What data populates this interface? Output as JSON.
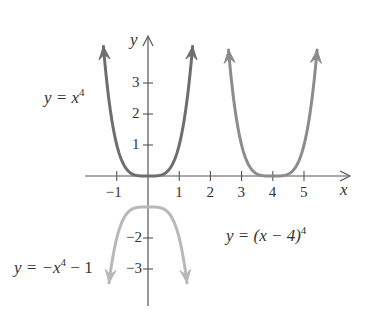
{
  "chart_data": {
    "type": "line",
    "title": "",
    "xlabel": "x",
    "ylabel": "y",
    "xlim": [
      -2,
      6.5
    ],
    "ylim": [
      -4.3,
      4.5
    ],
    "grid": false,
    "x_ticks": [
      -1,
      1,
      2,
      3,
      4,
      5
    ],
    "y_ticks": [
      -3,
      -2,
      -1,
      1,
      2,
      3
    ],
    "x_tick_labels": [
      "−1",
      "1",
      "2",
      "3",
      "4",
      "5"
    ],
    "y_tick_labels": [
      "−3",
      "−2",
      "1",
      "2",
      "3"
    ],
    "series": [
      {
        "name": "y = x^4",
        "expr": "x^4",
        "color": "#6e6e6e",
        "domain": [
          -1.43,
          1.43
        ],
        "direction": "up"
      },
      {
        "name": "y = (x - 4)^4",
        "expr": "(x-4)^4",
        "color": "#8c8c8c",
        "domain": [
          2.58,
          5.42
        ],
        "direction": "up"
      },
      {
        "name": "y = -x^4 - 1",
        "expr": "-x^4-1",
        "color": "#b8b8b8",
        "domain": [
          -1.25,
          1.25
        ],
        "direction": "down"
      }
    ],
    "annotations": [
      {
        "text": "y = x^4",
        "near": "upper-left"
      },
      {
        "text": "y = (x − 4)^4",
        "near": "lower-right"
      },
      {
        "text": "y = −x^4 − 1",
        "near": "lower-left"
      }
    ],
    "legend": "none (inline labels)"
  },
  "labels": {
    "y_axis": "y",
    "x_axis": "x",
    "eq1_prefix": "y = x",
    "eq1_exp": "4",
    "eq2_prefix": "y = (x − 4)",
    "eq2_exp": "4",
    "eq3_prefix": "y = −x",
    "eq3_exp": "4",
    "eq3_suffix": " − 1"
  }
}
